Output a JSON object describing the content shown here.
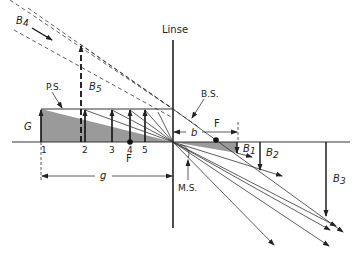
{
  "diagram": {
    "title": "Linse",
    "labels": {
      "lens": "Linse",
      "object": "G",
      "object_distance": "g",
      "image_distance": "b",
      "focal_left": "F",
      "focal_right": "F",
      "parallel_ray": "P.S.",
      "focal_ray": "B.S.",
      "center_ray": "M.S.",
      "positions": [
        "1",
        "2",
        "3",
        "4",
        "5"
      ],
      "images": [
        "B1",
        "B2",
        "B3",
        "B4",
        "B5"
      ],
      "image_main": [
        "B",
        "B",
        "B",
        "B",
        "B"
      ],
      "image_sub": [
        "1",
        "2",
        "3",
        "4",
        "5"
      ]
    }
  }
}
